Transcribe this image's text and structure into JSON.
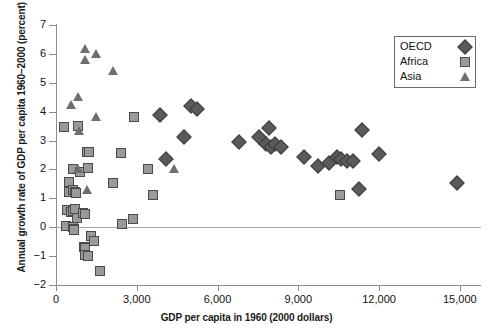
{
  "chart_data": {
    "type": "scatter",
    "title": "",
    "xlabel": "GDP per capita in 1960 (2000 dollars)",
    "ylabel": "Annual growth rate of GDP per capita 1960–2000 (percent)",
    "xlim": [
      0,
      15750
    ],
    "ylim": [
      -2,
      7
    ],
    "xticks": [
      0,
      3000,
      6000,
      9000,
      12000,
      15000
    ],
    "xticklabels": [
      "0",
      "3,000",
      "6,000",
      "9,000",
      "12,000",
      "15,000"
    ],
    "yticks": [
      -2,
      -1,
      0,
      1,
      2,
      3,
      4,
      5,
      6,
      7
    ],
    "yticklabels": [
      "−2",
      "−1",
      "0",
      "1",
      "2",
      "3",
      "4",
      "5",
      "6",
      "7"
    ],
    "grid": false,
    "zero_reference_line": 0,
    "legend_position": "top-right",
    "marker_colors": {
      "OECD": "#5a5a5a",
      "Africa": "#9a9a9a",
      "Asia": "#6e6e6e"
    },
    "series": [
      {
        "name": "OECD",
        "marker": "diamond",
        "points": [
          [
            3850,
            3.88
          ],
          [
            4100,
            2.37
          ],
          [
            4750,
            3.13
          ],
          [
            5000,
            4.18
          ],
          [
            5250,
            4.1
          ],
          [
            6800,
            2.95
          ],
          [
            7550,
            3.13
          ],
          [
            7900,
            3.42
          ],
          [
            7800,
            2.88
          ],
          [
            8000,
            2.78
          ],
          [
            8150,
            2.88
          ],
          [
            8350,
            2.78
          ],
          [
            9200,
            2.42
          ],
          [
            9750,
            2.12
          ],
          [
            10150,
            2.22
          ],
          [
            10450,
            2.42
          ],
          [
            10600,
            2.35
          ],
          [
            10800,
            2.3
          ],
          [
            11050,
            2.28
          ],
          [
            11350,
            3.38
          ],
          [
            11250,
            1.33
          ],
          [
            12000,
            2.52
          ],
          [
            14900,
            1.52
          ]
        ]
      },
      {
        "name": "Africa",
        "marker": "square",
        "points": [
          [
            300,
            3.47
          ],
          [
            800,
            3.5
          ],
          [
            500,
            1.58
          ],
          [
            470,
            1.22
          ],
          [
            620,
            1.3
          ],
          [
            700,
            1.22
          ],
          [
            760,
            1.18
          ],
          [
            420,
            0.58
          ],
          [
            560,
            0.52
          ],
          [
            640,
            0.55
          ],
          [
            700,
            0.62
          ],
          [
            780,
            0.32
          ],
          [
            380,
            0.05
          ],
          [
            640,
            0.02
          ],
          [
            680,
            -0.05
          ],
          [
            660,
            -0.08
          ],
          [
            640,
            2.02
          ],
          [
            880,
            1.92
          ],
          [
            1150,
            2.6
          ],
          [
            1230,
            2.6
          ],
          [
            1200,
            2.05
          ],
          [
            1050,
            -0.68
          ],
          [
            1060,
            -0.72
          ],
          [
            1080,
            -0.95
          ],
          [
            1180,
            -1.0
          ],
          [
            1000,
            0.48
          ],
          [
            1090,
            0.45
          ],
          [
            1300,
            -0.32
          ],
          [
            1420,
            -0.48
          ],
          [
            1620,
            -1.52
          ],
          [
            2100,
            1.52
          ],
          [
            2400,
            2.58
          ],
          [
            2450,
            0.1
          ],
          [
            2850,
            0.28
          ],
          [
            2900,
            3.8
          ],
          [
            3400,
            2.0
          ],
          [
            3600,
            1.12
          ],
          [
            10550,
            1.12
          ]
        ]
      },
      {
        "name": "Asia",
        "marker": "triangle",
        "points": [
          [
            570,
            4.22
          ],
          [
            800,
            4.5
          ],
          [
            840,
            3.32
          ],
          [
            1080,
            6.18
          ],
          [
            1090,
            5.78
          ],
          [
            1500,
            5.98
          ],
          [
            1500,
            3.82
          ],
          [
            2100,
            5.42
          ],
          [
            1150,
            1.3
          ],
          [
            800,
            2.0
          ],
          [
            4400,
            2.0
          ]
        ]
      }
    ]
  },
  "legend": {
    "entries": [
      {
        "label": "OECD",
        "marker": "diamond"
      },
      {
        "label": "Africa",
        "marker": "square"
      },
      {
        "label": "Asia",
        "marker": "triangle"
      }
    ]
  }
}
